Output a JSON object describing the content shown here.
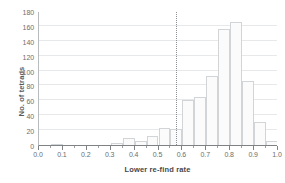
{
  "chart_data": {
    "type": "bar",
    "title": "",
    "subtitle": "",
    "xlabel": "Lower re-find rate",
    "ylabel": "No. of tetrads",
    "xlim": [
      0.0,
      1.0
    ],
    "ylim": [
      0,
      180
    ],
    "grid": "horizontal",
    "legend": "none",
    "bin_width": 0.05,
    "x_tick_labels": [
      "0.0",
      "0.1",
      "0.2",
      "0.3",
      "0.4",
      "0.5",
      "0.6",
      "0.7",
      "0.8",
      "0.9",
      "1.0"
    ],
    "x_tick_values": [
      0.0,
      0.1,
      0.2,
      0.3,
      0.4,
      0.5,
      0.6,
      0.7,
      0.8,
      0.9,
      1.0
    ],
    "x_minor_tick_values": [
      0.05,
      0.15,
      0.25,
      0.35,
      0.45,
      0.55,
      0.65,
      0.75,
      0.85,
      0.95
    ],
    "y_tick_labels": [
      "0",
      "20",
      "40",
      "60",
      "80",
      "100",
      "120",
      "140",
      "160",
      "180"
    ],
    "y_tick_values": [
      0,
      20,
      40,
      60,
      80,
      100,
      120,
      140,
      160,
      180
    ],
    "bins": [
      {
        "x0": 0.0,
        "x1": 0.05,
        "value": 0
      },
      {
        "x0": 0.05,
        "x1": 0.1,
        "value": 1
      },
      {
        "x0": 0.1,
        "x1": 0.15,
        "value": 0
      },
      {
        "x0": 0.15,
        "x1": 0.2,
        "value": 0
      },
      {
        "x0": 0.2,
        "x1": 0.25,
        "value": 0
      },
      {
        "x0": 0.25,
        "x1": 0.3,
        "value": 0
      },
      {
        "x0": 0.3,
        "x1": 0.35,
        "value": 3
      },
      {
        "x0": 0.35,
        "x1": 0.4,
        "value": 10
      },
      {
        "x0": 0.4,
        "x1": 0.45,
        "value": 5
      },
      {
        "x0": 0.45,
        "x1": 0.5,
        "value": 12
      },
      {
        "x0": 0.5,
        "x1": 0.55,
        "value": 23
      },
      {
        "x0": 0.55,
        "x1": 0.6,
        "value": 21
      },
      {
        "x0": 0.6,
        "x1": 0.65,
        "value": 60
      },
      {
        "x0": 0.65,
        "x1": 0.7,
        "value": 64
      },
      {
        "x0": 0.7,
        "x1": 0.75,
        "value": 93
      },
      {
        "x0": 0.75,
        "x1": 0.8,
        "value": 156
      },
      {
        "x0": 0.8,
        "x1": 0.85,
        "value": 165
      },
      {
        "x0": 0.85,
        "x1": 0.9,
        "value": 86
      },
      {
        "x0": 0.9,
        "x1": 0.95,
        "value": 31
      },
      {
        "x0": 0.95,
        "x1": 1.0,
        "value": 5
      }
    ],
    "annotations": [
      {
        "type": "vertical-dotted-line",
        "x": 0.575,
        "label": ""
      }
    ],
    "colors": {
      "bar_fill": "#fbfbfb",
      "bar_edge": "#d2d5d7",
      "gridline": "#e6e8ea",
      "axis": "#7f8284",
      "tick_text": "#6a6e71",
      "axis_title": "#44484b",
      "annotation_line": "#8d9093",
      "background": "#ffffff"
    }
  }
}
